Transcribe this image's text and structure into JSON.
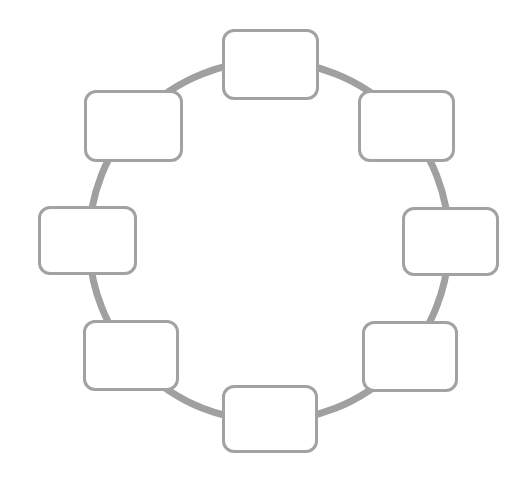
{
  "diagram": {
    "type": "ring",
    "ring": {
      "cx": 269,
      "cy": 241,
      "r": 180,
      "stroke": "#a0a0a0",
      "stroke_width": 7
    },
    "node_style": {
      "border_color": "#a2a2a2",
      "fill": "#ffffff",
      "corner_radius": 12
    },
    "nodes": [
      {
        "id": "top",
        "label": "",
        "x": 222,
        "y": 29,
        "w": 97,
        "h": 71
      },
      {
        "id": "top-right",
        "label": "",
        "x": 358,
        "y": 90,
        "w": 97,
        "h": 72
      },
      {
        "id": "right",
        "label": "",
        "x": 402,
        "y": 207,
        "w": 97,
        "h": 69
      },
      {
        "id": "bottom-right",
        "label": "",
        "x": 362,
        "y": 321,
        "w": 96,
        "h": 71
      },
      {
        "id": "bottom",
        "label": "",
        "x": 222,
        "y": 385,
        "w": 96,
        "h": 68
      },
      {
        "id": "bottom-left",
        "label": "",
        "x": 83,
        "y": 320,
        "w": 96,
        "h": 71
      },
      {
        "id": "left",
        "label": "",
        "x": 38,
        "y": 206,
        "w": 99,
        "h": 69
      },
      {
        "id": "top-left",
        "label": "",
        "x": 84,
        "y": 90,
        "w": 99,
        "h": 72
      }
    ]
  }
}
